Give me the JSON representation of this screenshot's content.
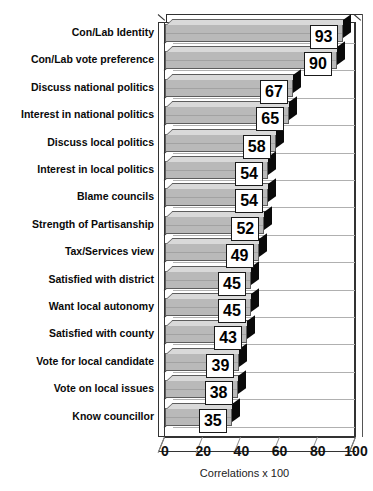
{
  "chart_data": {
    "type": "bar",
    "orientation": "horizontal",
    "title": "",
    "xlabel": "Correlations x 100",
    "ylabel": "",
    "xlim": [
      0,
      100
    ],
    "xticks": [
      0,
      20,
      40,
      60,
      80,
      100
    ],
    "grid": true,
    "legend": null,
    "categories": [
      "Con/Lab Identity",
      "Con/Lab vote preference",
      "Discuss national politics",
      "Interest in national politics",
      "Discuss local politics",
      "Interest in local politics",
      "Blame councils",
      "Strength of Partisanship",
      "Tax/Services view",
      "Satisfied with district",
      "Want local autonomy",
      "Satisfied with county",
      "Vote for local candidate",
      "Vote on local issues",
      "Know councillor"
    ],
    "values": [
      93,
      90,
      67,
      65,
      58,
      54,
      54,
      52,
      49,
      45,
      45,
      43,
      39,
      38,
      35
    ],
    "data_labels": [
      "93",
      "90",
      "67",
      "65",
      "58",
      "54",
      "54",
      "52",
      "49",
      "45",
      "45",
      "43",
      "39",
      "38",
      "35"
    ],
    "colors": {
      "bar_fill": "#b9b9b9",
      "bar_top": "#d9d9d9",
      "bar_shadow": "#0a0a0a",
      "outline": "#5d5d5d",
      "background": "#ffffff",
      "text": "#0a0a0a"
    },
    "style": "3d-horizontal-bar"
  },
  "axis": {
    "x_label": "Correlations x 100",
    "ticks": [
      "0",
      "20",
      "40",
      "60",
      "80",
      "100"
    ]
  },
  "title_remnant": {
    "header_fragment": "",
    "corner_fragment": ""
  }
}
